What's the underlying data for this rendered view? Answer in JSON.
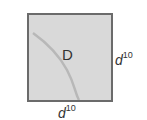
{
  "diagram": {
    "shape": "square",
    "inner_label": "D",
    "right_dimension": {
      "base": "d",
      "exponent": "10"
    },
    "bottom_dimension": {
      "base": "d",
      "exponent": "10"
    },
    "colors": {
      "fill": "#d9d9d9",
      "border": "#6b6b6b",
      "curve": "#b8b8b8",
      "text": "#333333"
    }
  }
}
